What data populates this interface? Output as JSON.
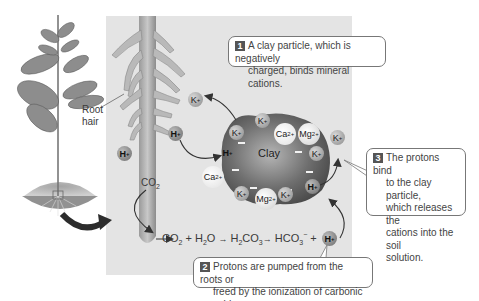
{
  "figure": {
    "plant_label": "Root hair",
    "root_hair_line1": "Root",
    "root_hair_line2": "hair",
    "clay_label": "Clay",
    "co2_root_label": "CO",
    "co2_root_sub": "2"
  },
  "callouts": [
    {
      "number": "1",
      "line1": "A clay particle, which is negatively",
      "line2": "charged, binds mineral cations."
    },
    {
      "number": "2",
      "line1": "Protons are pumped from the roots or",
      "line2": "freed by the ionization of carbonic acid."
    },
    {
      "number": "3",
      "line1": "The protons bind",
      "line2": "to the clay particle,",
      "line3": "which releases the",
      "line4": "cations into the soil",
      "line5": "solution."
    }
  ],
  "equation": {
    "terms": [
      "CO",
      "2",
      " + H",
      "2",
      "O ",
      "H",
      "2",
      "CO",
      "3",
      " HCO",
      "3",
      "−",
      " + "
    ],
    "text": "CO2 + H2O → H2CO3 → HCO3− + H+"
  },
  "ions": {
    "k": "K",
    "k_charge": "+",
    "h": "H",
    "h_charge": "+",
    "ca": "Ca",
    "ca_charge": "2+",
    "mg": "Mg",
    "mg_charge": "2+"
  },
  "colors": {
    "panel": "#e4e4e4",
    "clay": "#6a6a6a",
    "arrow": "#333333",
    "root": "#a8a8a8"
  }
}
